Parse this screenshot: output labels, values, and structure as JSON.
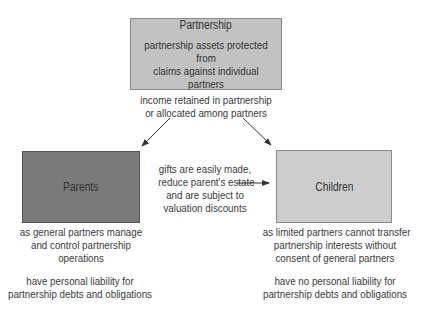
{
  "nodes": {
    "partnership": {
      "title": "Partnership",
      "description_line1": "partnership assets protected from",
      "description_line2": "claims against individual partners"
    },
    "parents": {
      "title": "Parents"
    },
    "children": {
      "title": "Children"
    }
  },
  "labels": {
    "income": [
      "income retained in partnership",
      "or allocated among partners"
    ],
    "gifts": [
      "gifts are easily made,",
      "reduce parent's estate",
      "and are subject to",
      "valuation discounts"
    ],
    "parents_control": [
      "as general partners manage",
      "and control partnership",
      "operations"
    ],
    "parents_liability": [
      "have personal liability for",
      "partnership debts and obligations"
    ],
    "children_transfer": [
      "as limited partners cannot transfer",
      "partnership interests without",
      "consent of general partners"
    ],
    "children_liability": [
      "have no personal liability for",
      "partnership debts and obligations"
    ]
  },
  "colors": {
    "partnership_fill": "#c2c2c2",
    "parents_fill": "#7a7a7a",
    "children_fill": "#cdcdcd",
    "arrow": "#333333"
  }
}
